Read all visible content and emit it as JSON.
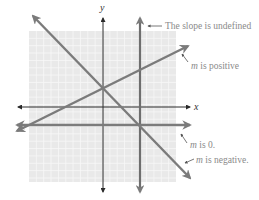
{
  "diagram": {
    "axes": {
      "x_label": "x",
      "y_label": "y"
    },
    "colors": {
      "grid_bg": "#e9e9e9",
      "grid_line": "#f7f7f7",
      "axis": "#2a2a2a",
      "line": "#7b7b7b",
      "callout_text": "#8a8a8a",
      "callout_arrow": "#555555"
    },
    "lines": [
      {
        "id": "undefined",
        "kind": "vertical",
        "slope": null,
        "annotation": "The slope is undefined"
      },
      {
        "id": "positive",
        "kind": "rising",
        "slope_sign": "positive",
        "annotation_prefix": "m",
        "annotation_rest": " is positive"
      },
      {
        "id": "zero",
        "kind": "horizontal",
        "slope": 0,
        "annotation_prefix": "m",
        "annotation_rest": " is 0."
      },
      {
        "id": "negative",
        "kind": "falling",
        "slope_sign": "negative",
        "annotation_prefix": "m",
        "annotation_rest": " is negative."
      }
    ]
  }
}
